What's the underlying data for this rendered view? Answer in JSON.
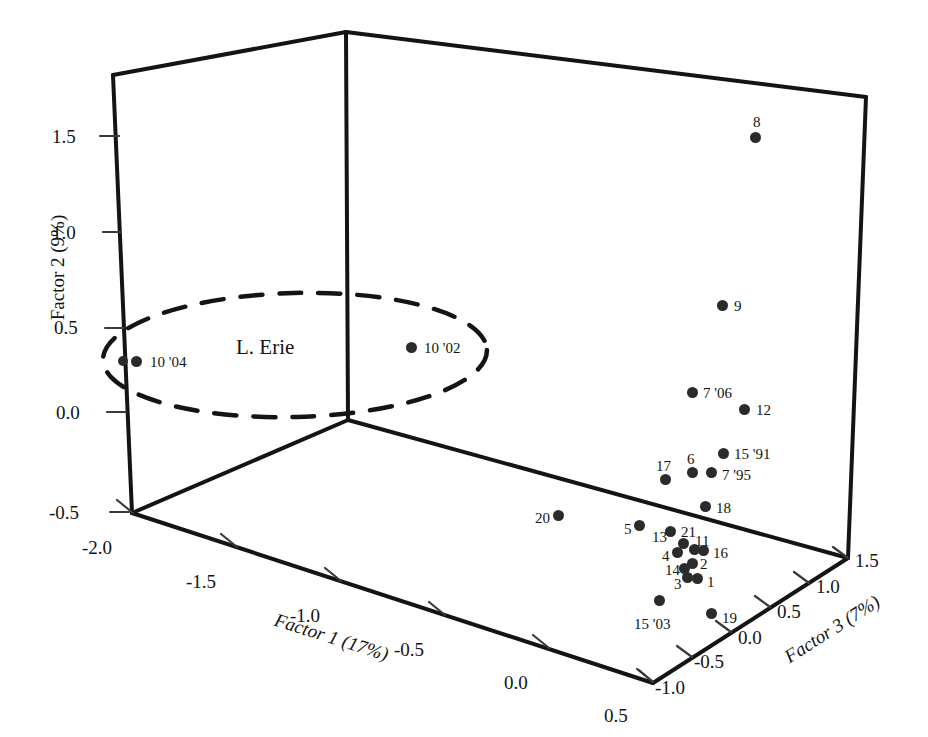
{
  "figure": {
    "type": "3d-scatter",
    "background": "#ffffff",
    "ink_color": "#1a1a1a",
    "point_color": "#2b2b2b"
  },
  "chart_data": {
    "type": "scatter",
    "title": "",
    "subtitle": "",
    "projection": "3d",
    "xlabel": "Factor 1 (17%)",
    "ylabel": "Factor 2 (9%)",
    "zlabel": "Factor 3 (7%)",
    "xlim": [
      -2.0,
      0.5
    ],
    "ylim": [
      -0.5,
      1.5
    ],
    "zlim": [
      -1.0,
      1.5
    ],
    "grid": false,
    "legend": null,
    "xticks": [
      "-2.0",
      "-1.5",
      "-1.0",
      "-0.5",
      "0.0",
      "0.5"
    ],
    "yticks": [
      "-0.5",
      "0.0",
      "0.5",
      "1.0",
      "1.5"
    ],
    "zticks": [
      "-1.0",
      "-0.5",
      "0.0",
      "0.5",
      "1.0",
      "1.5"
    ],
    "annotations": [
      {
        "text": "L. Erie",
        "shape": "dashed-ellipse",
        "encloses": [
          "10 '04",
          "10 '02"
        ]
      }
    ],
    "points": [
      {
        "label": "10 '04",
        "px": 136,
        "py": 361,
        "lx": 150,
        "ly": 355,
        "group": "L. Erie"
      },
      {
        "label": "",
        "px": 123,
        "py": 361,
        "lx": 0,
        "ly": 0,
        "group": "L. Erie"
      },
      {
        "label": "10 '02",
        "px": 411,
        "py": 347,
        "lx": 424,
        "ly": 341,
        "group": "L. Erie"
      },
      {
        "label": "8",
        "px": 755,
        "py": 137,
        "lx": 753,
        "ly": 115,
        "group": "main"
      },
      {
        "label": "9",
        "px": 722,
        "py": 305,
        "lx": 734,
        "ly": 299,
        "group": "main"
      },
      {
        "label": "7 '06",
        "px": 692,
        "py": 392,
        "lx": 703,
        "ly": 386,
        "group": "main"
      },
      {
        "label": "12",
        "px": 744,
        "py": 409,
        "lx": 756,
        "ly": 403,
        "group": "main"
      },
      {
        "label": "15 '91",
        "px": 723,
        "py": 453,
        "lx": 734,
        "ly": 447,
        "group": "main"
      },
      {
        "label": "6",
        "px": 692,
        "py": 472,
        "lx": 687,
        "ly": 452,
        "group": "main"
      },
      {
        "label": "7 '95",
        "px": 711,
        "py": 472,
        "lx": 722,
        "ly": 468,
        "group": "main"
      },
      {
        "label": "17",
        "px": 665,
        "py": 479,
        "lx": 656,
        "ly": 459,
        "group": "main"
      },
      {
        "label": "18",
        "px": 705,
        "py": 506,
        "lx": 716,
        "ly": 501,
        "group": "main"
      },
      {
        "label": "20",
        "px": 558,
        "py": 515,
        "lx": 535,
        "ly": 511,
        "group": "main"
      },
      {
        "label": "5",
        "px": 639,
        "py": 525,
        "lx": 624,
        "ly": 522,
        "group": "main"
      },
      {
        "label": "13",
        "px": 670,
        "py": 531,
        "lx": 652,
        "ly": 530,
        "group": "main"
      },
      {
        "label": "21",
        "px": 683,
        "py": 543,
        "lx": 681,
        "ly": 525,
        "group": "main"
      },
      {
        "label": "11",
        "px": 694,
        "py": 549,
        "lx": 695,
        "ly": 534,
        "group": "main"
      },
      {
        "label": "16",
        "px": 703,
        "py": 550,
        "lx": 713,
        "ly": 546,
        "group": "main"
      },
      {
        "label": "4",
        "px": 677,
        "py": 552,
        "lx": 662,
        "ly": 549,
        "group": "main"
      },
      {
        "label": "2",
        "px": 692,
        "py": 563,
        "lx": 700,
        "ly": 557,
        "group": "main"
      },
      {
        "label": "14",
        "px": 684,
        "py": 568,
        "lx": 665,
        "ly": 563,
        "group": "main"
      },
      {
        "label": "3",
        "px": 687,
        "py": 577,
        "lx": 674,
        "ly": 577,
        "group": "main"
      },
      {
        "label": "1",
        "px": 697,
        "py": 578,
        "lx": 707,
        "ly": 575,
        "group": "main"
      },
      {
        "label": "15 '03",
        "px": 659,
        "py": 600,
        "lx": 634,
        "ly": 617,
        "group": "main"
      },
      {
        "label": "19",
        "px": 711,
        "py": 613,
        "lx": 722,
        "ly": 611,
        "group": "main"
      }
    ]
  },
  "axes": {
    "y_axis": {
      "title": "Factor 2 (9%)",
      "ticks": [
        {
          "value": "1.5",
          "x": 62,
          "y": 130
        },
        {
          "value": "1.0",
          "x": 62,
          "y": 225
        },
        {
          "value": "0.5",
          "x": 62,
          "y": 321
        },
        {
          "value": "0.0",
          "x": 62,
          "y": 406
        },
        {
          "value": "-0.5",
          "x": 52,
          "y": 505
        }
      ]
    },
    "x_axis": {
      "title": "Factor 1 (17%)",
      "ticks": [
        {
          "value": "-2.0",
          "x": 112,
          "y": 538
        },
        {
          "value": "-1.5",
          "x": 213,
          "y": 569
        },
        {
          "value": "-1.0",
          "x": 313,
          "y": 602
        },
        {
          "value": "-0.5",
          "x": 414,
          "y": 634
        },
        {
          "value": "0.0",
          "x": 516,
          "y": 666
        },
        {
          "value": "0.5",
          "x": 617,
          "y": 698
        }
      ]
    },
    "z_axis": {
      "title": "Factor 3 (7%)",
      "ticks": [
        {
          "value": "-1.0",
          "x": 677,
          "y": 685
        },
        {
          "value": "-0.5",
          "x": 715,
          "y": 660
        },
        {
          "value": "0.0",
          "x": 754,
          "y": 634
        },
        {
          "value": "0.5",
          "x": 793,
          "y": 609
        },
        {
          "value": "1.0",
          "x": 831,
          "y": 583
        },
        {
          "value": "1.5",
          "x": 871,
          "y": 558
        }
      ]
    }
  },
  "region": {
    "label": "L. Erie",
    "label_x": 236,
    "label_y": 337
  }
}
